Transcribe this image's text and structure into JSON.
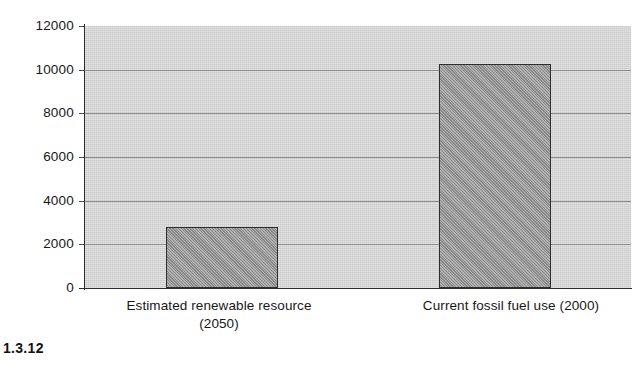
{
  "caption": "1.3.12",
  "chart_data": {
    "type": "bar",
    "title": "",
    "xlabel": "",
    "ylabel": "",
    "categories": [
      "Estimated renewable resource (2050)",
      "Current fossil fuel use (2000)"
    ],
    "category_lines": [
      [
        "Estimated renewable resource",
        "(2050)"
      ],
      [
        "Current fossil fuel use (2000)"
      ]
    ],
    "values": [
      2800,
      10250
    ],
    "ylim": [
      0,
      12000
    ],
    "ytick_interval": 2000,
    "ytick_labels": [
      "0",
      "2000",
      "4000",
      "6000",
      "8000",
      "10000",
      "12000"
    ],
    "ytick_values": [
      0,
      2000,
      4000,
      6000,
      8000,
      10000,
      12000
    ],
    "grid": true,
    "grid_axis": "y",
    "legend": false,
    "legend_position": "none",
    "colors": {
      "bar_fill": "#9a9a9a",
      "bar_outline": "#2e2e2e",
      "plot_background": "#d1d1d1",
      "gridline": "#8e8e8e",
      "axis": "#2b2b2b",
      "text": "#171717"
    }
  }
}
